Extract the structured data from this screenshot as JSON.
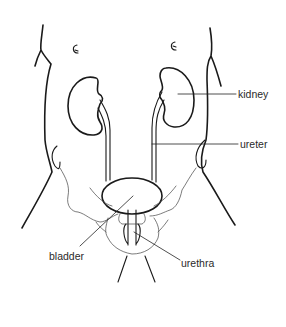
{
  "diagram": {
    "labels": {
      "kidney": "kidney",
      "ureter": "ureter",
      "bladder": "bladder",
      "urethra": "urethra"
    },
    "colors": {
      "line": "#1a1a1a",
      "text": "#2a2a2a",
      "background": "#ffffff"
    }
  }
}
